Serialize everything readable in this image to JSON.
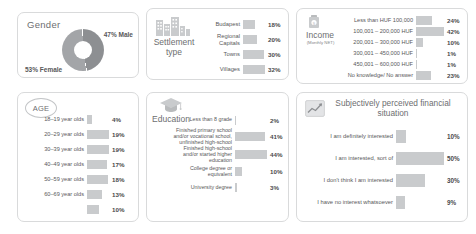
{
  "gender": {
    "title": "Gender",
    "male_label": "47% Male",
    "female_label": "53% Female",
    "chart_data": {
      "type": "pie",
      "title": "Gender",
      "categories": [
        "Male",
        "Female"
      ],
      "values": [
        47,
        53
      ],
      "unit": "%"
    }
  },
  "settlement": {
    "caption": "Settlement type",
    "icon": "city-buildings-icon",
    "chart_data": {
      "type": "bar",
      "title": "Settlement type",
      "categories": [
        "Budapest",
        "Regional Capitals",
        "Towns",
        "Villages"
      ],
      "values": [
        18,
        20,
        30,
        32
      ],
      "labels": [
        "18%",
        "20%",
        "30%",
        "32%"
      ],
      "unit": "%",
      "xlim": [
        0,
        32
      ]
    }
  },
  "income": {
    "caption": "Income",
    "subcaption": "(Monthly NET)",
    "icon": "money-bag-icon",
    "chart_data": {
      "type": "bar",
      "title": "Income (Monthly NET)",
      "categories": [
        "Less than HUF 100,000",
        "100,001 – 200,000 HUF",
        "200,001 – 300,000 HUF",
        "300,001 – 450,000 HUF",
        "450,001 – 600,000 HUF",
        "No knowledge/ No answer"
      ],
      "values": [
        24,
        42,
        10,
        1,
        1,
        23
      ],
      "labels": [
        "24%",
        "42%",
        "10%",
        "1%",
        "1%",
        "23%"
      ],
      "unit": "%",
      "xlim": [
        0,
        42
      ]
    }
  },
  "age": {
    "badge": "AGE",
    "chart_data": {
      "type": "bar",
      "title": "Age",
      "categories": [
        "18–19 year olds",
        "20–29 year olds",
        "30–39 year olds",
        "40–49 year olds",
        "50–59 year olds",
        "60–69 year olds",
        ""
      ],
      "values": [
        4,
        19,
        19,
        17,
        18,
        13,
        10
      ],
      "labels": [
        "4%",
        "19%",
        "19%",
        "17%",
        "18%",
        "13%",
        "10%"
      ],
      "unit": "%",
      "xlim": [
        0,
        19
      ]
    }
  },
  "education": {
    "caption": "Education",
    "icon": "graduation-cap-icon",
    "chart_data": {
      "type": "bar",
      "title": "Education",
      "categories": [
        "Less than 8 grade",
        "Finished primary school and/or vocational school, unfinished high-school",
        "Finished high-school and/or started higher education",
        "College degree or equivalent",
        "University degree"
      ],
      "values": [
        2,
        41,
        44,
        10,
        3
      ],
      "labels": [
        "2%",
        "41%",
        "44%",
        "10%",
        "3%"
      ],
      "unit": "%",
      "xlim": [
        0,
        44
      ]
    }
  },
  "financial": {
    "title": "Subjectively perceived financial situation",
    "icon": "line-chart-icon",
    "chart_data": {
      "type": "bar",
      "title": "Subjectively perceived financial situation",
      "categories": [
        "I am definitely interested",
        "I am interested, sort of",
        "I don't think I am interested",
        "I have no interest whatsoever"
      ],
      "values": [
        10,
        50,
        30,
        9
      ],
      "labels": [
        "10%",
        "50%",
        "30%",
        "9%"
      ],
      "unit": "%",
      "xlim": [
        0,
        50
      ]
    }
  },
  "colors": {
    "bar": "#c9cbcd",
    "donut_male": "#a3a5a8",
    "donut_female": "#8d8f92",
    "panel_border": "#d9dadb",
    "text": "#58585a"
  }
}
